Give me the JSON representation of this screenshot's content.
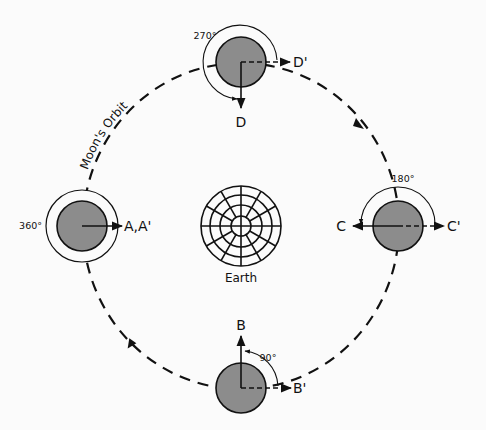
{
  "diagram": {
    "orbit_label": "Moon's Orbit",
    "earth_label": "Earth",
    "colors": {
      "moon_fill": "#8c8c8c",
      "stroke": "#111111",
      "background": "#fbfbfb"
    },
    "positions": [
      {
        "id": "left",
        "angle_label": "360°",
        "arrow_label": "A,A'"
      },
      {
        "id": "bottom",
        "angle_label": "90°",
        "arrow_label_solid": "B",
        "arrow_label_dashed": "B'"
      },
      {
        "id": "right",
        "angle_label": "180°",
        "arrow_label_solid": "C",
        "arrow_label_dashed": "C'"
      },
      {
        "id": "top",
        "angle_label": "270°",
        "arrow_label_solid": "D",
        "arrow_label_dashed": "D'"
      }
    ]
  }
}
